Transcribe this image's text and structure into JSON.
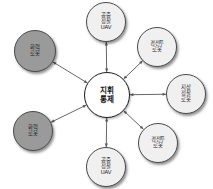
{
  "diagram": {
    "type": "hub-and-spoke network diagram",
    "canvas": {
      "width": 213,
      "height": 189,
      "background": "#ffffff"
    },
    "hub": {
      "id": "command-control",
      "lines": [
        "지휘",
        "통제"
      ],
      "cx": 107,
      "cy": 95,
      "r": 23,
      "fill": "#ffffff",
      "stroke": "#1c1c1c"
    },
    "nodes": [
      {
        "id": "aerial-recon-uav-top",
        "lines": [
          "공중",
          "정찰",
          "UAV"
        ],
        "cx": 106,
        "cy": 22,
        "r": 20,
        "fill": "#f0f0f0",
        "stroke": "#4a4a4a",
        "shade": "light"
      },
      {
        "id": "light-combat-robot-upper-right",
        "lines": [
          "경전투",
          "로봇"
        ],
        "cx": 157,
        "cy": 47,
        "r": 20,
        "fill": "#f0f0f0",
        "stroke": "#4a4a4a",
        "shade": "light"
      },
      {
        "id": "ground-recon-robot-right",
        "lines": [
          "지상",
          "정찰",
          "로봇"
        ],
        "cx": 186,
        "cy": 94,
        "r": 20,
        "fill": "#f0f0f0",
        "stroke": "#4a4a4a",
        "shade": "light"
      },
      {
        "id": "light-combat-robot-lower-right",
        "lines": [
          "경전투",
          "로봇"
        ],
        "cx": 158,
        "cy": 143,
        "r": 20,
        "fill": "#f0f0f0",
        "stroke": "#4a4a4a",
        "shade": "light"
      },
      {
        "id": "aerial-recon-uav-bottom",
        "lines": [
          "공중",
          "정찰",
          "UAV"
        ],
        "cx": 106,
        "cy": 167,
        "r": 20,
        "fill": "#f0f0f0",
        "stroke": "#4a4a4a",
        "shade": "light"
      },
      {
        "id": "firepower-robot-lower-left",
        "lines": [
          "화력",
          "로봇"
        ],
        "cx": 33,
        "cy": 131,
        "r": 20,
        "fill": "#9a9a9a",
        "stroke": "#4a4a4a",
        "shade": "dark"
      },
      {
        "id": "firepower-robot-upper-left",
        "lines": [
          "화력",
          "로봇"
        ],
        "cx": 35,
        "cy": 51,
        "r": 21,
        "fill": "#9a9a9a",
        "stroke": "#4a4a4a",
        "shade": "dark"
      }
    ],
    "edges": [
      {
        "id": "edge-hub-aerial-recon-uav-top",
        "from": "command-control",
        "to": "aerial-recon-uav-top",
        "direction": "bidirectional"
      },
      {
        "id": "edge-hub-light-combat-robot-upper-right",
        "from": "command-control",
        "to": "light-combat-robot-upper-right",
        "direction": "bidirectional"
      },
      {
        "id": "edge-hub-ground-recon-robot-right",
        "from": "command-control",
        "to": "ground-recon-robot-right",
        "direction": "bidirectional"
      },
      {
        "id": "edge-hub-light-combat-robot-lower-right",
        "from": "command-control",
        "to": "light-combat-robot-lower-right",
        "direction": "bidirectional"
      },
      {
        "id": "edge-hub-aerial-recon-uav-bottom",
        "from": "command-control",
        "to": "aerial-recon-uav-bottom",
        "direction": "bidirectional"
      },
      {
        "id": "edge-hub-firepower-robot-lower-left",
        "from": "command-control",
        "to": "firepower-robot-lower-left",
        "direction": "bidirectional"
      },
      {
        "id": "edge-hub-firepower-robot-upper-left",
        "from": "command-control",
        "to": "firepower-robot-upper-left",
        "direction": "bidirectional"
      }
    ],
    "edge_style": {
      "stroke": "#555555",
      "width": 0.9,
      "arrow_size": 3.4
    }
  }
}
